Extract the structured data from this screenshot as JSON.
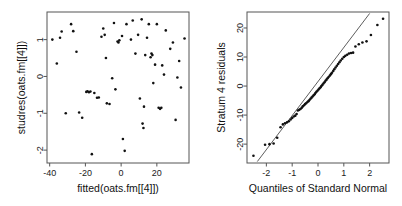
{
  "figure": {
    "width": 402,
    "height": 206,
    "background": "#ffffff",
    "point_color": "#111111",
    "axis_color": "#555555",
    "line_color": "#333333"
  },
  "chart_data": [
    {
      "type": "scatter",
      "panel": "left",
      "title": "",
      "xlabel": "fitted(oats.fm[[4]])",
      "ylabel": "studres(oats.fm[[4]])",
      "xticks": [
        -40,
        -20,
        0,
        20
      ],
      "xtick_labels": [
        "-40",
        "-20",
        "0",
        "20"
      ],
      "yticks": [
        1,
        0,
        -1,
        -2
      ],
      "ytick_labels": [
        "1",
        "0",
        "-1",
        "-2"
      ],
      "xlim": [
        -41.5,
        38.0
      ],
      "ylim": [
        -2.35,
        1.75
      ],
      "grid": false,
      "legend": "none",
      "points": [
        [
          -38.5,
          1.0
        ],
        [
          -36.0,
          0.35
        ],
        [
          -34.2,
          1.05
        ],
        [
          -33.3,
          1.22
        ],
        [
          -31.0,
          -1.0
        ],
        [
          -28.0,
          1.42
        ],
        [
          -26.8,
          1.23
        ],
        [
          -25.0,
          0.67
        ],
        [
          -23.5,
          -0.98
        ],
        [
          -21.8,
          -1.12
        ],
        [
          -19.5,
          -0.42
        ],
        [
          -18.8,
          -0.4
        ],
        [
          -18.0,
          -0.43
        ],
        [
          -17.2,
          -0.41
        ],
        [
          -16.4,
          -2.11
        ],
        [
          -15.0,
          -0.45
        ],
        [
          -13.5,
          -0.58
        ],
        [
          -12.5,
          -0.57
        ],
        [
          -11.0,
          1.08
        ],
        [
          -10.0,
          1.3
        ],
        [
          -9.2,
          1.13
        ],
        [
          -8.5,
          0.5
        ],
        [
          -8.0,
          -0.73
        ],
        [
          -6.5,
          -0.75
        ],
        [
          -5.0,
          -0.05
        ],
        [
          -4.0,
          1.45
        ],
        [
          -3.2,
          -0.35
        ],
        [
          -2.0,
          0.95
        ],
        [
          -1.5,
          0.92
        ],
        [
          -1.0,
          0.98
        ],
        [
          0.5,
          1.1
        ],
        [
          1.0,
          -1.7
        ],
        [
          2.0,
          -2.02
        ],
        [
          3.0,
          1.42
        ],
        [
          5.5,
          1.0
        ],
        [
          6.5,
          1.52
        ],
        [
          8.0,
          0.62
        ],
        [
          9.5,
          1.13
        ],
        [
          10.5,
          -0.6
        ],
        [
          11.5,
          1.55
        ],
        [
          12.0,
          -1.28
        ],
        [
          12.5,
          -1.4
        ],
        [
          12.8,
          -0.82
        ],
        [
          13.5,
          0.58
        ],
        [
          14.5,
          1.05
        ],
        [
          15.5,
          1.42
        ],
        [
          16.5,
          0.52
        ],
        [
          17.0,
          0.62
        ],
        [
          17.5,
          0.58
        ],
        [
          18.0,
          -0.18
        ],
        [
          19.0,
          0.32
        ],
        [
          20.0,
          1.42
        ],
        [
          21.0,
          -0.85
        ],
        [
          21.8,
          -0.88
        ],
        [
          22.5,
          -0.85
        ],
        [
          23.0,
          0.3
        ],
        [
          24.0,
          0.05
        ],
        [
          25.0,
          1.25
        ],
        [
          27.5,
          0.75
        ],
        [
          29.0,
          0.92
        ],
        [
          30.5,
          -1.18
        ],
        [
          31.5,
          -0.03
        ],
        [
          32.5,
          0.42
        ],
        [
          33.5,
          -0.3
        ],
        [
          35.5,
          1.03
        ]
      ]
    },
    {
      "type": "scatter",
      "panel": "right",
      "title": "",
      "xlabel": "Quantiles of Standard Normal",
      "ylabel": "Stratum 4 residuals",
      "xticks": [
        -2,
        -1,
        0,
        1,
        2
      ],
      "xtick_labels": [
        "-2",
        "-1",
        "0",
        "1",
        "2"
      ],
      "yticks": [
        20,
        10,
        0,
        -10,
        -20
      ],
      "ytick_labels": [
        "20",
        "10",
        "0",
        "-10",
        "-20"
      ],
      "xlim": [
        -2.75,
        2.75
      ],
      "ylim": [
        -26.5,
        25.5
      ],
      "grid": false,
      "legend": "none",
      "reference_line": {
        "x0": -2.35,
        "y0": -26.0,
        "x1": 2.0,
        "y1": 25.0
      },
      "points": [
        [
          -2.5,
          -24.0
        ],
        [
          -2.05,
          -20.2
        ],
        [
          -1.88,
          -20.0
        ],
        [
          -1.72,
          -19.8
        ],
        [
          -1.58,
          -17.8
        ],
        [
          -1.45,
          -14.2
        ],
        [
          -1.36,
          -13.2
        ],
        [
          -1.28,
          -12.8
        ],
        [
          -1.2,
          -12.5
        ],
        [
          -1.13,
          -12.1
        ],
        [
          -1.06,
          -11.5
        ],
        [
          -1.0,
          -11.0
        ],
        [
          -0.94,
          -10.5
        ],
        [
          -0.88,
          -10.2
        ],
        [
          -0.83,
          -9.6
        ],
        [
          -0.78,
          -8.4
        ],
        [
          -0.73,
          -8.2
        ],
        [
          -0.68,
          -7.9
        ],
        [
          -0.63,
          -7.5
        ],
        [
          -0.59,
          -7.0
        ],
        [
          -0.54,
          -6.6
        ],
        [
          -0.5,
          -6.2
        ],
        [
          -0.46,
          -5.9
        ],
        [
          -0.41,
          -5.5
        ],
        [
          -0.37,
          -5.2
        ],
        [
          -0.33,
          -4.8
        ],
        [
          -0.29,
          -4.4
        ],
        [
          -0.25,
          -4.0
        ],
        [
          -0.21,
          -3.6
        ],
        [
          -0.17,
          -3.2
        ],
        [
          -0.13,
          -2.8
        ],
        [
          -0.1,
          -2.4
        ],
        [
          -0.06,
          -2.0
        ],
        [
          -0.02,
          -1.6
        ],
        [
          0.02,
          -1.2
        ],
        [
          0.06,
          -0.8
        ],
        [
          0.1,
          -0.4
        ],
        [
          0.13,
          0.0
        ],
        [
          0.17,
          0.4
        ],
        [
          0.21,
          0.9
        ],
        [
          0.25,
          1.3
        ],
        [
          0.29,
          1.8
        ],
        [
          0.33,
          2.2
        ],
        [
          0.37,
          2.7
        ],
        [
          0.41,
          3.1
        ],
        [
          0.46,
          3.6
        ],
        [
          0.5,
          4.1
        ],
        [
          0.54,
          4.6
        ],
        [
          0.59,
          5.2
        ],
        [
          0.63,
          5.8
        ],
        [
          0.68,
          6.4
        ],
        [
          0.73,
          7.0
        ],
        [
          0.78,
          7.6
        ],
        [
          0.83,
          8.2
        ],
        [
          0.88,
          8.8
        ],
        [
          0.94,
          9.4
        ],
        [
          1.0,
          10.0
        ],
        [
          1.06,
          10.4
        ],
        [
          1.13,
          10.8
        ],
        [
          1.2,
          11.2
        ],
        [
          1.28,
          11.4
        ],
        [
          1.36,
          11.5
        ],
        [
          1.45,
          13.6
        ],
        [
          1.58,
          14.4
        ],
        [
          1.72,
          15.0
        ],
        [
          1.88,
          15.4
        ],
        [
          2.05,
          17.6
        ],
        [
          2.3,
          21.0
        ],
        [
          2.52,
          23.2
        ]
      ]
    }
  ]
}
